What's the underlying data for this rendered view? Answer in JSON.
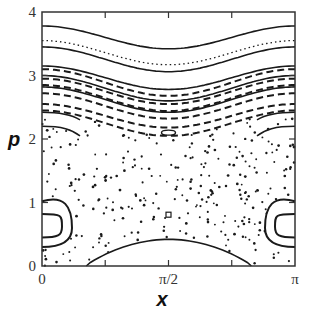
{
  "chart_data": {
    "type": "scatter",
    "title": "",
    "subtitle": "Poincaré section (phase portrait)",
    "xlabel": "x",
    "ylabel": "p",
    "xlim": [
      0,
      3.14159
    ],
    "ylim": [
      0,
      4
    ],
    "x_ticks": [
      {
        "value": 0,
        "label": "0"
      },
      {
        "value": 1.5708,
        "label": "π/2"
      },
      {
        "value": 3.14159,
        "label": "π"
      }
    ],
    "x_minor_ticks": [
      0.785,
      2.356
    ],
    "y_ticks": [
      {
        "value": 0,
        "label": "0"
      },
      {
        "value": 1,
        "label": "1"
      },
      {
        "value": 2,
        "label": "2"
      },
      {
        "value": 3,
        "label": "3"
      },
      {
        "value": 4,
        "label": "4"
      }
    ],
    "grid": false,
    "legend": "none",
    "colors": {
      "ink": "#1a1a1a",
      "axis": "#333333"
    },
    "invariant_curves": [
      {
        "name": "kam-1",
        "style": "solid",
        "p_edge": 3.78,
        "p_center": 3.42
      },
      {
        "name": "kam-2",
        "style": "dotted",
        "p_edge": 3.55,
        "p_center": 3.17
      },
      {
        "name": "kam-3",
        "style": "solid",
        "p_edge": 3.45,
        "p_center": 3.06
      },
      {
        "name": "kam-4",
        "style": "solid",
        "p_edge": 3.15,
        "p_center": 2.78
      },
      {
        "name": "kam-5",
        "style": "dashed",
        "p_edge": 3.1,
        "p_center": 2.68
      },
      {
        "name": "kam-6",
        "style": "dashed",
        "p_edge": 2.95,
        "p_center": 2.55
      },
      {
        "name": "kam-7",
        "style": "solid",
        "p_edge": 3.0,
        "p_center": 2.6
      },
      {
        "name": "kam-8",
        "style": "dashed",
        "p_edge": 2.85,
        "p_center": 2.44
      },
      {
        "name": "kam-9",
        "style": "dashed",
        "p_edge": 2.72,
        "p_center": 2.32
      },
      {
        "name": "kam-10",
        "style": "solid",
        "p_edge": 2.82,
        "p_center": 2.42
      },
      {
        "name": "kam-11",
        "style": "dashed",
        "p_edge": 2.55,
        "p_center": 2.18
      },
      {
        "name": "kam-12",
        "style": "dashed",
        "p_edge": 2.45,
        "p_center": 2.05
      }
    ],
    "islands": [
      {
        "name": "resonance-island-edge",
        "x_center": 0,
        "p_center": 0.65,
        "note": "two nested closed curves at x=0 and x=π"
      },
      {
        "name": "small-island-upper",
        "x_center": 1.5708,
        "p_center": 2.1
      },
      {
        "name": "small-island-lower",
        "x_center": 1.5708,
        "p_center": 0.8
      }
    ],
    "separatrix_bottom": {
      "x_start": 0.55,
      "x_end": 2.6,
      "p_peak": 0.42
    },
    "chaotic_sea": {
      "p_range": [
        0,
        2.4
      ],
      "description": "scattered points"
    }
  }
}
